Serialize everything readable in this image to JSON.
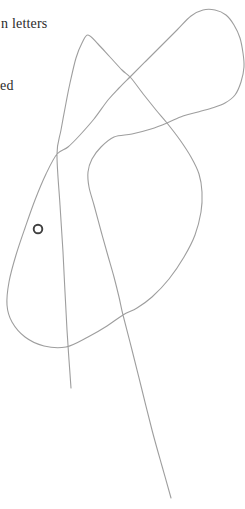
{
  "page": {
    "background": "#ffffff",
    "text_color": "#2b2b2b",
    "fragments": [
      {
        "text": "n letters",
        "x": 1,
        "y": 17,
        "font_size": 14
      },
      {
        "text": "ed",
        "x": 0,
        "y": 79,
        "font_size": 14
      }
    ]
  },
  "figure": {
    "curve_color": "#9e9e9e",
    "curve_width": 1.1,
    "curve_points": [
      [
        71,
        388
      ],
      [
        69,
        360
      ],
      [
        67,
        330
      ],
      [
        65,
        292
      ],
      [
        63,
        252
      ],
      [
        60,
        205
      ],
      [
        57,
        154
      ],
      [
        61,
        130
      ],
      [
        66,
        103
      ],
      [
        70,
        83
      ],
      [
        76,
        58
      ],
      [
        82,
        43
      ],
      [
        88,
        35
      ],
      [
        98,
        44
      ],
      [
        110,
        57
      ],
      [
        122,
        70
      ],
      [
        131,
        78
      ],
      [
        144,
        95
      ],
      [
        156,
        110
      ],
      [
        167,
        123
      ],
      [
        180,
        140
      ],
      [
        191,
        157
      ],
      [
        199,
        174
      ],
      [
        202,
        192
      ],
      [
        201,
        212
      ],
      [
        195,
        235
      ],
      [
        184,
        257
      ],
      [
        169,
        279
      ],
      [
        152,
        297
      ],
      [
        137,
        308
      ],
      [
        123,
        315
      ],
      [
        107,
        326
      ],
      [
        88,
        337
      ],
      [
        66,
        347
      ],
      [
        44,
        346
      ],
      [
        25,
        337
      ],
      [
        12,
        322
      ],
      [
        7,
        305
      ],
      [
        9,
        282
      ],
      [
        16,
        255
      ],
      [
        25,
        228
      ],
      [
        35,
        200
      ],
      [
        46,
        174
      ],
      [
        57,
        154
      ],
      [
        68,
        147
      ],
      [
        80,
        135
      ],
      [
        94,
        119
      ],
      [
        108,
        100
      ],
      [
        119,
        88
      ],
      [
        131,
        76
      ],
      [
        146,
        61
      ],
      [
        162,
        45
      ],
      [
        177,
        30
      ],
      [
        191,
        16
      ],
      [
        203,
        10
      ],
      [
        215,
        10
      ],
      [
        226,
        15
      ],
      [
        234,
        25
      ],
      [
        240,
        38
      ],
      [
        243,
        53
      ],
      [
        244,
        67
      ],
      [
        241,
        82
      ],
      [
        235,
        95
      ],
      [
        225,
        103
      ],
      [
        212,
        108
      ],
      [
        198,
        112
      ],
      [
        183,
        116
      ],
      [
        167,
        123
      ],
      [
        151,
        129
      ],
      [
        132,
        134
      ],
      [
        114,
        137
      ],
      [
        101,
        147
      ],
      [
        92,
        159
      ],
      [
        88,
        172
      ],
      [
        89,
        187
      ],
      [
        94,
        205
      ],
      [
        101,
        231
      ],
      [
        108,
        256
      ],
      [
        114,
        277
      ],
      [
        119,
        297
      ],
      [
        123,
        315
      ],
      [
        132,
        350
      ],
      [
        142,
        390
      ],
      [
        152,
        430
      ],
      [
        162,
        466
      ],
      [
        171,
        498
      ]
    ],
    "marker": {
      "cx": 38,
      "cy": 229,
      "r": 4.3,
      "stroke_width": 1.9,
      "color": "#3f3f3f",
      "fill": "#ffffff"
    }
  }
}
